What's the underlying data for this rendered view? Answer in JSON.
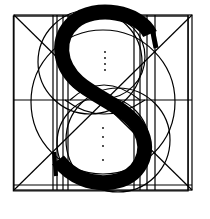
{
  "figure": {
    "letter": "S",
    "colors": {
      "background": "#ffffff",
      "ink": "#000000"
    },
    "frame": {
      "x": 14,
      "y": 16,
      "width": 76,
      "height": 76
    },
    "elements": [
      "outer-square",
      "diagonals",
      "vertical-guides",
      "horizontal-midline",
      "construction-circles",
      "dotted-center-axis",
      "letter-s-stroke"
    ]
  }
}
